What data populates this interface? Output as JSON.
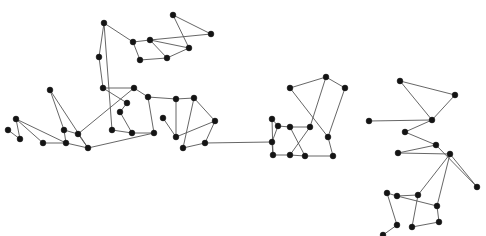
{
  "figure": {
    "width": 486,
    "height": 236,
    "background_color": "#ffffff",
    "node_color": "#141414",
    "edge_color": "#555555",
    "node_radius": 2.9,
    "edge_width": 0.9,
    "node_count": 63,
    "edge_count": 67
  },
  "chart_data": {
    "type": "scatter",
    "title": "",
    "xlabel": "",
    "ylabel": "",
    "grid": false,
    "legend": "none",
    "xlim": [
      0,
      486
    ],
    "ylim": [
      0,
      236
    ],
    "nodes": [
      {
        "id": 0,
        "x": 16,
        "y": 119
      },
      {
        "id": 1,
        "x": 20,
        "y": 139
      },
      {
        "id": 2,
        "x": 43,
        "y": 143
      },
      {
        "id": 3,
        "x": 50,
        "y": 90
      },
      {
        "id": 4,
        "x": 64,
        "y": 130
      },
      {
        "id": 5,
        "x": 78,
        "y": 134
      },
      {
        "id": 6,
        "x": 66,
        "y": 143
      },
      {
        "id": 7,
        "x": 88,
        "y": 148
      },
      {
        "id": 8,
        "x": 99,
        "y": 57
      },
      {
        "id": 9,
        "x": 103,
        "y": 88
      },
      {
        "id": 10,
        "x": 104,
        "y": 23
      },
      {
        "id": 11,
        "x": 133,
        "y": 42
      },
      {
        "id": 12,
        "x": 140,
        "y": 60
      },
      {
        "id": 13,
        "x": 134,
        "y": 88
      },
      {
        "id": 14,
        "x": 148,
        "y": 97
      },
      {
        "id": 15,
        "x": 127,
        "y": 103
      },
      {
        "id": 16,
        "x": 112,
        "y": 130
      },
      {
        "id": 17,
        "x": 132,
        "y": 133
      },
      {
        "id": 18,
        "x": 154,
        "y": 133
      },
      {
        "id": 19,
        "x": 150,
        "y": 40
      },
      {
        "id": 20,
        "x": 167,
        "y": 58
      },
      {
        "id": 21,
        "x": 173,
        "y": 15
      },
      {
        "id": 22,
        "x": 211,
        "y": 34
      },
      {
        "id": 23,
        "x": 189,
        "y": 48
      },
      {
        "id": 24,
        "x": 176,
        "y": 99
      },
      {
        "id": 25,
        "x": 194,
        "y": 98
      },
      {
        "id": 26,
        "x": 215,
        "y": 121
      },
      {
        "id": 27,
        "x": 176,
        "y": 137
      },
      {
        "id": 28,
        "x": 183,
        "y": 148
      },
      {
        "id": 29,
        "x": 205,
        "y": 143
      },
      {
        "id": 30,
        "x": 272,
        "y": 119
      },
      {
        "id": 31,
        "x": 272,
        "y": 142
      },
      {
        "id": 32,
        "x": 278,
        "y": 126
      },
      {
        "id": 33,
        "x": 290,
        "y": 88
      },
      {
        "id": 34,
        "x": 290,
        "y": 127
      },
      {
        "id": 35,
        "x": 310,
        "y": 127
      },
      {
        "id": 36,
        "x": 326,
        "y": 77
      },
      {
        "id": 37,
        "x": 328,
        "y": 137
      },
      {
        "id": 38,
        "x": 345,
        "y": 88
      },
      {
        "id": 39,
        "x": 273,
        "y": 155
      },
      {
        "id": 40,
        "x": 290,
        "y": 155
      },
      {
        "id": 41,
        "x": 305,
        "y": 156
      },
      {
        "id": 42,
        "x": 333,
        "y": 156
      },
      {
        "id": 43,
        "x": 369,
        "y": 121
      },
      {
        "id": 44,
        "x": 400,
        "y": 81
      },
      {
        "id": 45,
        "x": 455,
        "y": 95
      },
      {
        "id": 46,
        "x": 432,
        "y": 120
      },
      {
        "id": 47,
        "x": 405,
        "y": 132
      },
      {
        "id": 48,
        "x": 436,
        "y": 145
      },
      {
        "id": 49,
        "x": 398,
        "y": 153
      },
      {
        "id": 50,
        "x": 450,
        "y": 154
      },
      {
        "id": 51,
        "x": 477,
        "y": 187
      },
      {
        "id": 52,
        "x": 387,
        "y": 193
      },
      {
        "id": 53,
        "x": 397,
        "y": 196
      },
      {
        "id": 54,
        "x": 418,
        "y": 195
      },
      {
        "id": 55,
        "x": 437,
        "y": 206
      },
      {
        "id": 56,
        "x": 397,
        "y": 225
      },
      {
        "id": 57,
        "x": 412,
        "y": 227
      },
      {
        "id": 58,
        "x": 439,
        "y": 222
      },
      {
        "id": 59,
        "x": 8,
        "y": 130
      },
      {
        "id": 60,
        "x": 383,
        "y": 235
      },
      {
        "id": 61,
        "x": 163,
        "y": 118
      },
      {
        "id": 62,
        "x": 120,
        "y": 112
      }
    ],
    "edges": [
      [
        0,
        2
      ],
      [
        0,
        6
      ],
      [
        1,
        59
      ],
      [
        1,
        0
      ],
      [
        2,
        6
      ],
      [
        3,
        4
      ],
      [
        3,
        7
      ],
      [
        4,
        5
      ],
      [
        4,
        6
      ],
      [
        5,
        7
      ],
      [
        5,
        13
      ],
      [
        6,
        7
      ],
      [
        7,
        18
      ],
      [
        8,
        10
      ],
      [
        8,
        9
      ],
      [
        9,
        15
      ],
      [
        9,
        13
      ],
      [
        10,
        11
      ],
      [
        10,
        16
      ],
      [
        11,
        12
      ],
      [
        11,
        19
      ],
      [
        12,
        20
      ],
      [
        13,
        14
      ],
      [
        14,
        24
      ],
      [
        14,
        18
      ],
      [
        15,
        62
      ],
      [
        16,
        17
      ],
      [
        17,
        18
      ],
      [
        17,
        62
      ],
      [
        19,
        20
      ],
      [
        19,
        23
      ],
      [
        20,
        23
      ],
      [
        21,
        22
      ],
      [
        21,
        23
      ],
      [
        22,
        19
      ],
      [
        24,
        25
      ],
      [
        24,
        27
      ],
      [
        25,
        26
      ],
      [
        25,
        28
      ],
      [
        26,
        27
      ],
      [
        26,
        29
      ],
      [
        27,
        61
      ],
      [
        28,
        29
      ],
      [
        29,
        31
      ],
      [
        30,
        32
      ],
      [
        30,
        39
      ],
      [
        31,
        32
      ],
      [
        31,
        39
      ],
      [
        32,
        34
      ],
      [
        33,
        36
      ],
      [
        33,
        37
      ],
      [
        34,
        35
      ],
      [
        34,
        41
      ],
      [
        35,
        36
      ],
      [
        35,
        40
      ],
      [
        36,
        38
      ],
      [
        37,
        42
      ],
      [
        38,
        37
      ],
      [
        39,
        40
      ],
      [
        40,
        41
      ],
      [
        41,
        42
      ],
      [
        43,
        46
      ],
      [
        44,
        45
      ],
      [
        44,
        46
      ],
      [
        45,
        46
      ],
      [
        46,
        47
      ],
      [
        47,
        48
      ],
      [
        48,
        49
      ],
      [
        48,
        51
      ],
      [
        49,
        50
      ],
      [
        50,
        51
      ],
      [
        50,
        54
      ],
      [
        52,
        53
      ],
      [
        52,
        56
      ],
      [
        53,
        54
      ],
      [
        53,
        55
      ],
      [
        54,
        57
      ],
      [
        55,
        58
      ],
      [
        56,
        60
      ],
      [
        57,
        58
      ],
      [
        55,
        50
      ]
    ]
  }
}
